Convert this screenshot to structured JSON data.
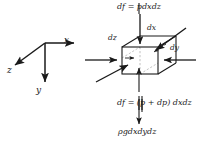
{
  "figure": {
    "background_color": "#ffffff",
    "stroke_color": "#1a1a1a",
    "dashed_color": "#9a9a9a"
  },
  "axes": {
    "x_label": "x",
    "y_label": "y",
    "z_label": "z"
  },
  "cube": {
    "dx_label": "dx",
    "dy_label": "dy",
    "dz_label": "dz"
  },
  "equations": {
    "top_force": "df = pdxdz",
    "bottom_force": "df = (p + dp) dxdz",
    "weight": "ρgdxdydz"
  }
}
